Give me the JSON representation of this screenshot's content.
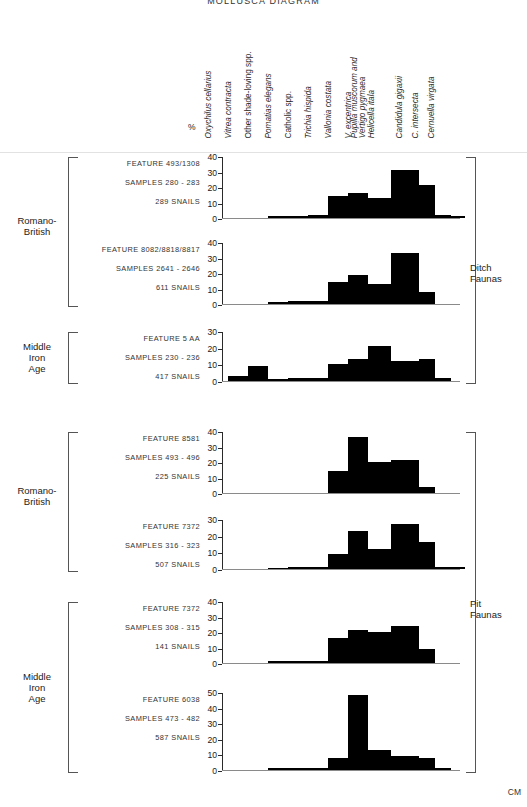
{
  "title": "MOLLUSCA DIAGRAM",
  "axis_unit_label": "%",
  "scale_label": "CM",
  "species": [
    {
      "name": "Oxychilus cellarius",
      "style": "italic"
    },
    {
      "name": "Vitrea contracta",
      "style": "italic"
    },
    {
      "name": "Other shade-loving spp.",
      "style": "roman"
    },
    {
      "name": "Pomatias elegans",
      "style": "italic"
    },
    {
      "name": "Catholic spp.",
      "style": "roman"
    },
    {
      "name": "Trichia hispida",
      "style": "italic"
    },
    {
      "name": "Vallonia costata",
      "style": "italic"
    },
    {
      "name": "V. excentrica",
      "style": "italic"
    },
    {
      "name": "Pupilla muscorum and\nVertigo pygmaea\nHelicella itala",
      "style": "italic"
    },
    {
      "name": "Candidula gigaxii",
      "style": "italic"
    },
    {
      "name": "C. intersecta",
      "style": "italic"
    },
    {
      "name": "Cernuella virgata",
      "style": "italic"
    }
  ],
  "groups": [
    {
      "label": "Ditch\nFaunas"
    },
    {
      "label": "Pit\nFaunas"
    }
  ],
  "eras": [
    {
      "label": "Romano-\nBritish"
    },
    {
      "label": "Middle\nIron\nAge"
    },
    {
      "label": "Romano-\nBritish"
    },
    {
      "label": "Middle\nIron\nAge"
    }
  ],
  "chart_data": {
    "type": "bar",
    "title": "MOLLUSCA DIAGRAM",
    "xlabel": "",
    "ylabel": "%",
    "grid": false,
    "legend": "none",
    "categories": [
      "Oxychilus cellarius",
      "Vitrea contracta",
      "Other shade-loving spp.",
      "Pomatias elegans",
      "Catholic spp.",
      "Trichia hispida",
      "Vallonia costata",
      "V. excentrica",
      "Pupilla muscorum and Vertigo pygmaea Helicella itala",
      "Candidula gigaxii",
      "C. intersecta",
      "Cernuella virgata"
    ],
    "panels": [
      {
        "feature": "FEATURE  493/1308",
        "samples": "SAMPLES  280 - 283",
        "snails": "289  SNAILS",
        "group": "Ditch Faunas",
        "era": "Romano-British",
        "ylim": [
          0,
          40
        ],
        "yticks": [
          0,
          10,
          20,
          30,
          40
        ],
        "values": [
          0,
          0,
          1,
          1.5,
          2,
          14,
          16,
          13,
          31,
          21,
          2,
          1
        ]
      },
      {
        "feature": "FEATURE  8082/8818/8817",
        "samples": "SAMPLES  2641 - 2646",
        "snails": "611  SNAILS",
        "group": "Ditch Faunas",
        "era": "Romano-British",
        "ylim": [
          0,
          40
        ],
        "yticks": [
          0,
          10,
          20,
          30,
          40
        ],
        "values": [
          0,
          0,
          1.5,
          2,
          2,
          14,
          19,
          13,
          33,
          8,
          0,
          0
        ]
      },
      {
        "feature": "FEATURE  5 AA",
        "samples": "SAMPLES  230 - 236",
        "snails": "417  SNAILS",
        "group": "Ditch Faunas",
        "era": "Middle Iron Age",
        "ylim": [
          0,
          30
        ],
        "yticks": [
          0,
          10,
          20,
          30
        ],
        "values": [
          3,
          9,
          1,
          2,
          2,
          10,
          13,
          21,
          12,
          13,
          2,
          0
        ]
      },
      {
        "feature": "FEATURE  8581",
        "samples": "SAMPLES  493 - 496",
        "snails": "225  SNAILS",
        "group": "Pit Faunas",
        "era": "Romano-British",
        "ylim": [
          0,
          40
        ],
        "yticks": [
          0,
          10,
          20,
          30,
          40
        ],
        "values": [
          0,
          0,
          0,
          0,
          0,
          14,
          36,
          20,
          21,
          4,
          0,
          0
        ]
      },
      {
        "feature": "FEATURE  7372",
        "samples": "SAMPLES  316 - 323",
        "snails": "507  SNAILS",
        "group": "Pit Faunas",
        "era": "Romano-British",
        "ylim": [
          0,
          30
        ],
        "yticks": [
          0,
          10,
          20,
          30
        ],
        "values": [
          0,
          0,
          0.5,
          1,
          1.5,
          9,
          23,
          12,
          27,
          16,
          1,
          1
        ]
      },
      {
        "feature": "FEATURE  7372",
        "samples": "SAMPLES  308 - 315",
        "snails": "141  SNAILS",
        "group": "Pit Faunas",
        "era": "Middle Iron Age",
        "ylim": [
          0,
          40
        ],
        "yticks": [
          0,
          10,
          20,
          30,
          40
        ],
        "values": [
          0,
          0,
          1,
          1,
          1,
          16,
          21,
          20,
          24,
          9,
          0,
          0
        ]
      },
      {
        "feature": "FEATURE  6038",
        "samples": "SAMPLES  473 - 482",
        "snails": "587  SNAILS",
        "group": "Pit Faunas",
        "era": "Middle Iron Age",
        "ylim": [
          0,
          50
        ],
        "yticks": [
          0,
          10,
          20,
          30,
          40,
          50
        ],
        "values": [
          0,
          0,
          1,
          1,
          1,
          8,
          48,
          13,
          9,
          8,
          1,
          0
        ]
      }
    ]
  }
}
